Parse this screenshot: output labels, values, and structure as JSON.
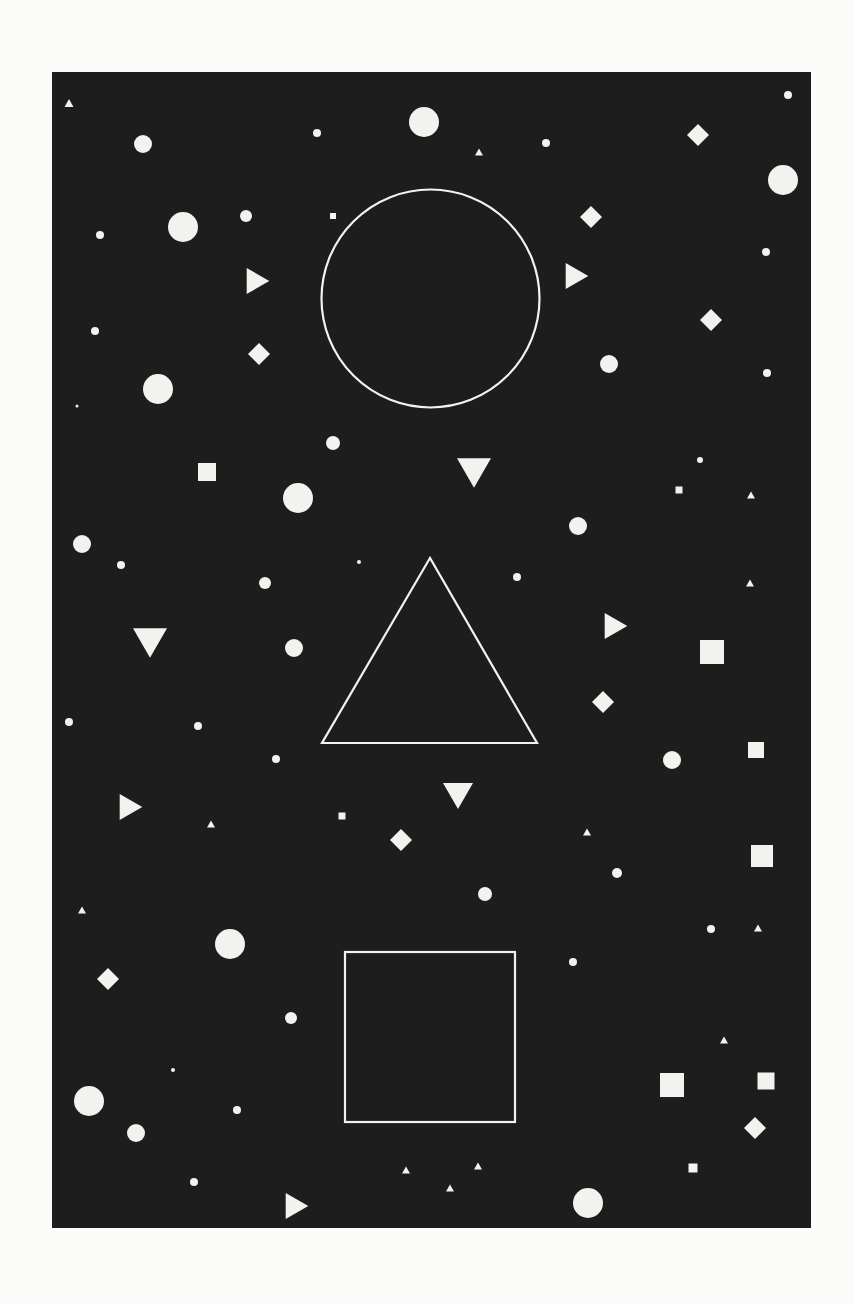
{
  "canvas": {
    "width": 855,
    "height": 1304,
    "background": "#fbfbfa"
  },
  "poster": {
    "x": 52,
    "y": 72,
    "width": 759,
    "height": 1156,
    "background": "#1d1d1d",
    "fill": "#f2f2ee",
    "stroke_width": 2.2
  },
  "outlines": [
    {
      "type": "circle",
      "cx": 430.5,
      "cy": 298.5,
      "r": 109
    },
    {
      "type": "triangle",
      "points": [
        [
          430,
          558
        ],
        [
          322,
          743
        ],
        [
          537,
          743
        ]
      ]
    },
    {
      "type": "square",
      "x": 345,
      "y": 952,
      "size": 170
    }
  ],
  "circles": [
    [
      143,
      144,
      9
    ],
    [
      317,
      133,
      4
    ],
    [
      424,
      122,
      15
    ],
    [
      546,
      143,
      4
    ],
    [
      788,
      95,
      4
    ],
    [
      783,
      180,
      15
    ],
    [
      183,
      227,
      15
    ],
    [
      100,
      235,
      4
    ],
    [
      246,
      216,
      6
    ],
    [
      766,
      252,
      4
    ],
    [
      95,
      331,
      4
    ],
    [
      158,
      389,
      15
    ],
    [
      77,
      406,
      1.5
    ],
    [
      609,
      364,
      9
    ],
    [
      767,
      373,
      4
    ],
    [
      333,
      443,
      7
    ],
    [
      298,
      498,
      15
    ],
    [
      82,
      544,
      9
    ],
    [
      121,
      565,
      4
    ],
    [
      359,
      562,
      2
    ],
    [
      265,
      583,
      6
    ],
    [
      578,
      526,
      9
    ],
    [
      700,
      460,
      3
    ],
    [
      517,
      577,
      4
    ],
    [
      294,
      648,
      9
    ],
    [
      69,
      722,
      4
    ],
    [
      198,
      726,
      4
    ],
    [
      276,
      759,
      4
    ],
    [
      672,
      760,
      9
    ],
    [
      485,
      894,
      7
    ],
    [
      617,
      873,
      5
    ],
    [
      711,
      929,
      4
    ],
    [
      573,
      962,
      4
    ],
    [
      230,
      944,
      15
    ],
    [
      291,
      1018,
      6
    ],
    [
      173,
      1070,
      2
    ],
    [
      89,
      1101,
      15
    ],
    [
      136,
      1133,
      9
    ],
    [
      237,
      1110,
      4
    ],
    [
      194,
      1182,
      4
    ],
    [
      588,
      1203,
      15
    ]
  ],
  "squares": [
    [
      333,
      216,
      6
    ],
    [
      207,
      472,
      18
    ],
    [
      679,
      490,
      7
    ],
    [
      712,
      652,
      24
    ],
    [
      756,
      750,
      16
    ],
    [
      342,
      816,
      7
    ],
    [
      762,
      856,
      22
    ],
    [
      672,
      1085,
      24
    ],
    [
      766,
      1081,
      17
    ],
    [
      693,
      1168,
      9
    ]
  ],
  "diamonds": [
    [
      698,
      135,
      22
    ],
    [
      591,
      217,
      22
    ],
    [
      259,
      354,
      22
    ],
    [
      711,
      320,
      22
    ],
    [
      603,
      702,
      22
    ],
    [
      401,
      840,
      22
    ],
    [
      108,
      979,
      22
    ],
    [
      755,
      1128,
      22
    ]
  ],
  "triangles_right": [
    [
      258,
      281,
      26
    ],
    [
      577,
      276,
      26
    ],
    [
      616,
      626,
      26
    ],
    [
      131,
      807,
      26
    ],
    [
      297,
      1206,
      26
    ]
  ],
  "triangles_down": [
    [
      474,
      473,
      34
    ],
    [
      150,
      643,
      34
    ],
    [
      458,
      796,
      30
    ]
  ],
  "triangles_up_small": [
    [
      69,
      103,
      9
    ],
    [
      479,
      152,
      8
    ],
    [
      751,
      495,
      8
    ],
    [
      750,
      583,
      8
    ],
    [
      211,
      824,
      8
    ],
    [
      587,
      832,
      8
    ],
    [
      82,
      910,
      8
    ],
    [
      758,
      928,
      8
    ],
    [
      724,
      1040,
      8
    ],
    [
      406,
      1170,
      8
    ],
    [
      450,
      1188,
      8
    ],
    [
      478,
      1166,
      8
    ]
  ]
}
